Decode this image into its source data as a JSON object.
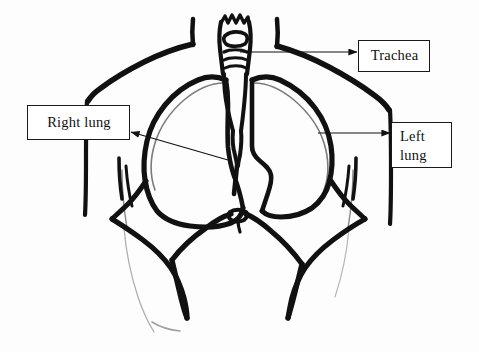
{
  "figure": {
    "background_color": "#fdfdfd",
    "ink_color": "#111111",
    "label_border_color": "#1a1a1a",
    "label_text_color": "#101010",
    "callouts": [
      {
        "id": "trachea",
        "label": "Trachea",
        "arrow": "arrow-right",
        "arrow_direction": "right"
      },
      {
        "id": "right-lung",
        "label": "Right lung",
        "arrow": "arrow-left-diagonal",
        "arrow_direction": "left"
      },
      {
        "id": "left-lung",
        "label": "Left\nlung",
        "arrow": "arrow-right",
        "arrow_direction": "right"
      }
    ]
  }
}
